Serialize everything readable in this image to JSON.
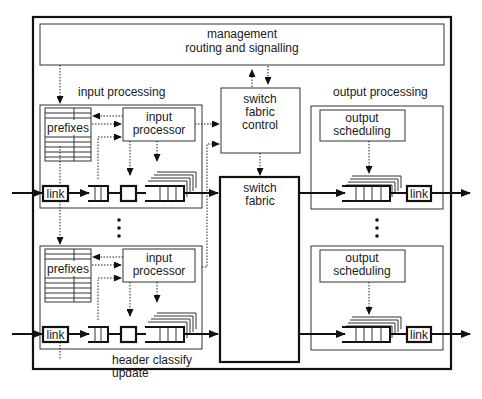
{
  "diagram": {
    "management": {
      "line1": "management",
      "line2": "routing and signalling"
    },
    "input_section": {
      "title": "input processing"
    },
    "output_section": {
      "title": "output processing"
    },
    "switch_fabric_control": {
      "line1": "switch",
      "line2": "fabric",
      "line3": "control"
    },
    "switch_fabric": {
      "line1": "switch",
      "line2": "fabric"
    },
    "input_units": [
      {
        "prefixes": "prefixes",
        "processor_line1": "input",
        "processor_line2": "processor",
        "link": "link"
      },
      {
        "prefixes": "prefixes",
        "processor_line1": "input",
        "processor_line2": "processor",
        "link": "link"
      }
    ],
    "output_units": [
      {
        "scheduler_line1": "output",
        "scheduler_line2": "scheduling",
        "link": "link"
      },
      {
        "scheduler_line1": "output",
        "scheduler_line2": "scheduling",
        "link": "link"
      }
    ],
    "annotation": {
      "line1": "header classify",
      "line2": "update"
    }
  }
}
